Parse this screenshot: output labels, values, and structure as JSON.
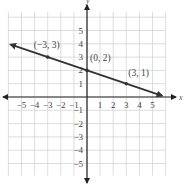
{
  "chart_data": {
    "type": "line",
    "title": "",
    "xlabel": "x",
    "ylabel": "y",
    "xlim": [
      -6,
      6
    ],
    "ylim": [
      -6,
      6
    ],
    "grid": true,
    "x_ticks": [
      -5,
      -4,
      -3,
      -2,
      -1,
      1,
      2,
      3,
      4,
      5
    ],
    "y_ticks": [
      -5,
      -4,
      -3,
      -2,
      -1,
      1,
      2,
      3,
      4,
      5
    ],
    "x_tick_labels": [
      "−5",
      "−4",
      "−3",
      "−2",
      "−1",
      "1",
      "2",
      "3",
      "4",
      "5"
    ],
    "y_tick_labels": [
      "−5",
      "−4",
      "−3",
      "−2",
      "−1",
      "1",
      "2",
      "3",
      "4",
      "5"
    ],
    "series": [
      {
        "name": "y = -x/3 + 2",
        "slope": -0.3333,
        "intercept": 2,
        "line_extent_x": [
          -5.8,
          5.7
        ],
        "arrows_both_ends": true,
        "points": [
          {
            "x": -3,
            "y": 3,
            "label": "(−3, 3)"
          },
          {
            "x": 0,
            "y": 2,
            "label": "(0, 2)"
          },
          {
            "x": 3,
            "y": 1,
            "label": "(3, 1)"
          }
        ]
      }
    ]
  },
  "colors": {
    "grid": "#d4d4d4",
    "axis": "#222222",
    "line": "#333333",
    "text": "#444444"
  }
}
